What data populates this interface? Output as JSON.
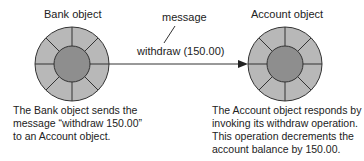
{
  "diagram": {
    "sender": {
      "title": "Bank object",
      "description_lines": [
        "The Bank object sends the",
        "message “withdraw 150.00”",
        "to an Account object."
      ]
    },
    "receiver": {
      "title": "Account object",
      "description_lines": [
        "The Account object responds by",
        "invoking its withdraw operation.",
        "This operation decrements the",
        "account balance by 150.00."
      ]
    },
    "message": {
      "label": "message",
      "call": "withdraw (150.00)"
    },
    "colors": {
      "outer_ring": "#b8b8b8",
      "inner_core": "#8e8e8e",
      "stroke": "#333333"
    }
  }
}
